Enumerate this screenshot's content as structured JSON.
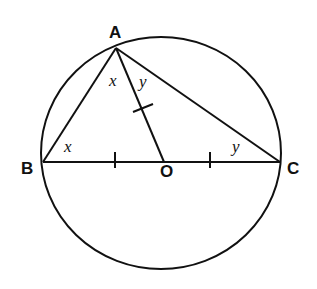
{
  "diagram": {
    "type": "geometry",
    "circle": {
      "center": "O",
      "cx": 161,
      "cy": 153,
      "rx": 120,
      "ry": 116
    },
    "points": {
      "A": {
        "label": "A",
        "x": 116,
        "y": 48
      },
      "B": {
        "label": "B",
        "x": 43,
        "y": 162
      },
      "C": {
        "label": "C",
        "x": 280,
        "y": 162
      },
      "O": {
        "label": "O",
        "x": 166,
        "y": 162
      }
    },
    "segments": [
      "AB",
      "AC",
      "BC",
      "AO"
    ],
    "equal_marks": [
      "BO",
      "OC",
      "AO"
    ],
    "angle_labels": {
      "angle_BAO": "x",
      "angle_ABO": "x",
      "angle_OAC": "y",
      "angle_OCA": "y"
    }
  }
}
